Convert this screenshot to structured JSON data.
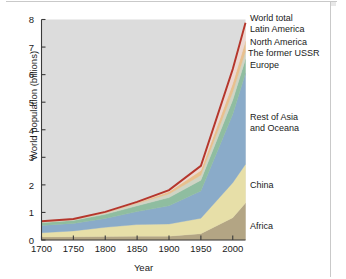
{
  "figure": {
    "plot_background": "#dcdcdc",
    "axis_color": "#3a3a3a"
  },
  "axes": {
    "ylabel": "World population (billions)",
    "xlabel": "Year",
    "yticks": [
      "0",
      "1",
      "2",
      "3",
      "4",
      "5",
      "6",
      "7",
      "8"
    ],
    "xticks": [
      "1700",
      "1750",
      "1800",
      "1850",
      "1900",
      "1950",
      "2000"
    ]
  },
  "labels": {
    "world_total": "World total",
    "latin_america": "Latin America",
    "north_america": "North America",
    "former_ussr": "The former USSR",
    "europe": "Europe",
    "rest_of_asia": "Rest of Asia",
    "and_oceana": "and Oceana",
    "china": "China",
    "africa": "Africa"
  },
  "chart_data": {
    "type": "area",
    "title": "",
    "xlabel": "Year",
    "ylabel": "World population (billions)",
    "xlim": [
      1700,
      2020
    ],
    "ylim": [
      0,
      8
    ],
    "grid": false,
    "legend_position": "right-inline",
    "stacked": true,
    "x": [
      1700,
      1750,
      1800,
      1850,
      1900,
      1950,
      2000,
      2020
    ],
    "series": [
      {
        "name": "Africa",
        "color": "#b3a584",
        "values": [
          0.11,
          0.12,
          0.13,
          0.14,
          0.14,
          0.23,
          0.81,
          1.34
        ]
      },
      {
        "name": "China",
        "color": "#e7dfa8",
        "values": [
          0.15,
          0.21,
          0.33,
          0.42,
          0.44,
          0.56,
          1.27,
          1.41
        ]
      },
      {
        "name": "Rest of Asia and Oceana",
        "color": "#8aabc9",
        "values": [
          0.27,
          0.27,
          0.32,
          0.47,
          0.66,
          0.99,
          2.48,
          3.3
        ]
      },
      {
        "name": "Europe",
        "color": "#8fbda0",
        "values": [
          0.1,
          0.11,
          0.15,
          0.21,
          0.3,
          0.39,
          0.52,
          0.51
        ]
      },
      {
        "name": "The former USSR",
        "color": "#cfd4c4",
        "values": [
          0.03,
          0.03,
          0.05,
          0.08,
          0.13,
          0.18,
          0.29,
          0.29
        ]
      },
      {
        "name": "North America",
        "color": "#e8c08e",
        "values": [
          0.01,
          0.01,
          0.02,
          0.03,
          0.08,
          0.17,
          0.31,
          0.37
        ]
      },
      {
        "name": "Latin America",
        "color": "#ecd8d2",
        "values": [
          0.01,
          0.01,
          0.02,
          0.03,
          0.06,
          0.17,
          0.52,
          0.66
        ]
      }
    ],
    "total_line": {
      "name": "World total",
      "color": "#b5362c",
      "values": [
        0.68,
        0.76,
        1.02,
        1.38,
        1.81,
        2.69,
        6.2,
        7.88
      ]
    }
  }
}
